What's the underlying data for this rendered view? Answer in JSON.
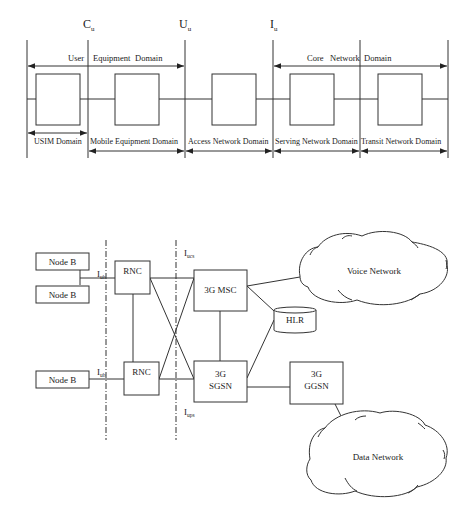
{
  "top_diagram": {
    "reference_points": {
      "cu": {
        "main": "C",
        "sub": "u"
      },
      "uu": {
        "main": "U",
        "sub": "u"
      },
      "iu": {
        "main": "I",
        "sub": "u"
      }
    },
    "upper_domains": {
      "user_equipment": {
        "w1": "User",
        "w2": "Equipment",
        "w3": "Domain"
      },
      "core_network": {
        "w1": "Core",
        "w2": "Network",
        "w3": "Domain"
      }
    },
    "lower_domains": [
      {
        "label": "USIM Domain"
      },
      {
        "label": "Mobile Equipment Domain"
      },
      {
        "label": "Access Network Domain"
      },
      {
        "label": "Serving Network Domain"
      },
      {
        "label": "Transit Network Domain"
      }
    ]
  },
  "bottom_diagram": {
    "nodes": {
      "node_b_1": "Node B",
      "node_b_2": "Node B",
      "node_b_3": "Node B",
      "rnc_1": "RNC",
      "rnc_2": "RNC",
      "msc": "3G MSC",
      "hlr": "HLR",
      "sgsn_line1": "3G",
      "sgsn_line2": "SGSN",
      "ggsn_line1": "3G",
      "ggsn_line2": "GGSN",
      "voice_network": "Voice Network",
      "data_network": "Data Network"
    },
    "interfaces": {
      "iub_1": {
        "main": "I",
        "sub": "ub"
      },
      "iub_2": {
        "main": "I",
        "sub": "ub"
      },
      "iucs": {
        "main": "I",
        "sub": "ucs"
      },
      "iups": {
        "main": "I",
        "sub": "ups"
      }
    }
  }
}
